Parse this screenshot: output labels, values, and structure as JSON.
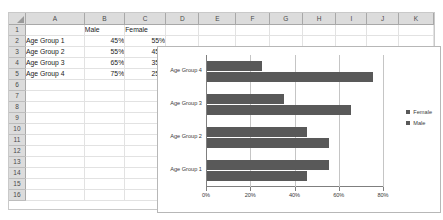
{
  "spreadsheet": {
    "columns": [
      "A",
      "B",
      "C",
      "D",
      "E",
      "F",
      "G",
      "H",
      "I",
      "J",
      "K"
    ],
    "rows": [
      "1",
      "2",
      "3",
      "4",
      "5",
      "6",
      "7",
      "8",
      "9",
      "10",
      "11",
      "12",
      "13",
      "14",
      "15",
      "16"
    ],
    "cells": {
      "A1": "",
      "B1": "Male",
      "C1": "Female",
      "A2": "Age Group 1",
      "B2": "45%",
      "C2": "55%",
      "A3": "Age Group 2",
      "B3": "55%",
      "C3": "45%",
      "A4": "Age Group 3",
      "B4": "65%",
      "C4": "35%",
      "A5": "Age Group 4",
      "B5": "75%",
      "C5": "25%"
    },
    "corner_name": "select-all-corner"
  },
  "chart_data": {
    "type": "bar",
    "orientation": "horizontal",
    "title": "",
    "xlabel": "",
    "ylabel": "",
    "categories": [
      "Age Group 1",
      "Age Group 2",
      "Age Group 3",
      "Age Group 4"
    ],
    "series": [
      {
        "name": "Male",
        "values": [
          45,
          55,
          65,
          75
        ],
        "color": "#595959"
      },
      {
        "name": "Female",
        "values": [
          55,
          45,
          35,
          25
        ],
        "color": "#595959"
      }
    ],
    "xlim": [
      0,
      80
    ],
    "xticks": [
      0,
      20,
      40,
      60,
      80
    ],
    "xtick_labels": [
      "0%",
      "20%",
      "40%",
      "60%",
      "80%"
    ],
    "grid": "vertical",
    "legend_position": "right",
    "legend_entries": [
      "Female",
      "Male"
    ]
  }
}
